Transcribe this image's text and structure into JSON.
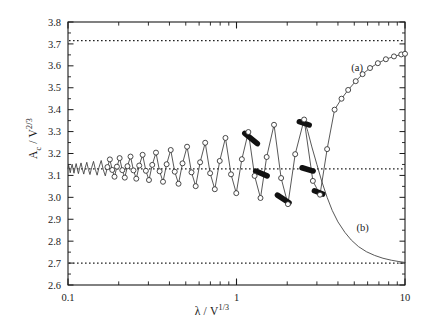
{
  "chart_data": {
    "type": "line",
    "title": "",
    "xlabel": "λ / V^(1/3)",
    "ylabel": "A_c / V^(2/3)",
    "xscale": "log",
    "yscale": "linear",
    "xlim": [
      0.1,
      10
    ],
    "ylim": [
      2.6,
      3.8
    ],
    "grid": false,
    "legend": "none",
    "x_ticks_major": [
      0.1,
      1,
      10
    ],
    "x_tick_labels": [
      "0.1",
      "1",
      "10"
    ],
    "x_ticks_minor": [
      0.2,
      0.3,
      0.4,
      0.5,
      0.6,
      0.7,
      0.8,
      0.9,
      2,
      3,
      4,
      5,
      6,
      7,
      8,
      9
    ],
    "y_ticks": [
      2.6,
      2.7,
      2.8,
      2.9,
      3.0,
      3.1,
      3.2,
      3.3,
      3.4,
      3.5,
      3.6,
      3.7,
      3.8
    ],
    "y_tick_labels": [
      "2.6",
      "2.7",
      "2.8",
      "2.9",
      "3.0",
      "3.1",
      "3.2",
      "3.3",
      "3.4",
      "3.5",
      "3.6",
      "3.7",
      "3.8"
    ],
    "asymptotes": [
      {
        "name": "upper-asymptote",
        "value": 3.715,
        "style": "dotted"
      },
      {
        "name": "middle-asymptote",
        "value": 3.13,
        "style": "dotted"
      },
      {
        "name": "lower-asymptote",
        "value": 2.7,
        "style": "dotted"
      }
    ],
    "annotations": [
      {
        "name": "branch-a-label",
        "text": "(a)",
        "x": 5.2,
        "y": 3.575
      },
      {
        "name": "branch-b-label",
        "text": "(b)",
        "x": 5.6,
        "y": 2.845
      }
    ],
    "series": [
      {
        "name": "spiral-branch",
        "description": "Oscillating spiral curve converging to the middle asymptote at small lambda and unwinding toward branch (a) at large lambda",
        "marker": "open-circle",
        "points": [
          [
            0.1,
            3.13
          ],
          [
            0.1008,
            3.147
          ],
          [
            0.1021,
            3.128
          ],
          [
            0.1031,
            3.112
          ],
          [
            0.1043,
            3.131
          ],
          [
            0.1058,
            3.151
          ],
          [
            0.1072,
            3.129
          ],
          [
            0.1085,
            3.11
          ],
          [
            0.11,
            3.132
          ],
          [
            0.1118,
            3.154
          ],
          [
            0.1136,
            3.128
          ],
          [
            0.1153,
            3.108
          ],
          [
            0.1172,
            3.133
          ],
          [
            0.1195,
            3.157
          ],
          [
            0.1218,
            3.128
          ],
          [
            0.124,
            3.106
          ],
          [
            0.1264,
            3.134
          ],
          [
            0.1293,
            3.16
          ],
          [
            0.1322,
            3.127
          ],
          [
            0.135,
            3.104
          ],
          [
            0.1381,
            3.135
          ],
          [
            0.1417,
            3.164
          ],
          [
            0.1454,
            3.127
          ],
          [
            0.1489,
            3.101
          ],
          [
            0.1528,
            3.137
          ],
          [
            0.1574,
            3.168
          ],
          [
            0.162,
            3.126
          ],
          [
            0.1665,
            3.098
          ],
          [
            0.1714,
            3.138
          ],
          [
            0.1772,
            3.173
          ],
          [
            0.1831,
            3.125
          ],
          [
            0.1888,
            3.094
          ],
          [
            0.1951,
            3.14
          ],
          [
            0.2025,
            3.179
          ],
          [
            0.21,
            3.124
          ],
          [
            0.2173,
            3.09
          ],
          [
            0.2254,
            3.142
          ],
          [
            0.235,
            3.186
          ],
          [
            0.2447,
            3.123
          ],
          [
            0.2542,
            3.085
          ],
          [
            0.2647,
            3.145
          ],
          [
            0.2772,
            3.194
          ],
          [
            0.2899,
            3.121
          ],
          [
            0.3024,
            3.079
          ],
          [
            0.3162,
            3.148
          ],
          [
            0.3327,
            3.204
          ],
          [
            0.3496,
            3.119
          ],
          [
            0.3663,
            3.071
          ],
          [
            0.3848,
            3.151
          ],
          [
            0.4071,
            3.216
          ],
          [
            0.43,
            3.117
          ],
          [
            0.4528,
            3.062
          ],
          [
            0.4781,
            3.155
          ],
          [
            0.5089,
            3.231
          ],
          [
            0.5407,
            3.114
          ],
          [
            0.5726,
            3.051
          ],
          [
            0.6082,
            3.16
          ],
          [
            0.652,
            3.249
          ],
          [
            0.6975,
            3.11
          ],
          [
            0.7435,
            3.037
          ],
          [
            0.7952,
            3.166
          ],
          [
            0.86,
            3.271
          ],
          [
            0.928,
            3.105
          ],
          [
            0.997,
            3.019
          ],
          [
            1.076,
            3.174
          ],
          [
            1.176,
            3.298
          ],
          [
            1.281,
            3.098
          ],
          [
            1.388,
            2.997
          ],
          [
            1.51,
            3.184
          ],
          [
            1.67,
            3.331
          ],
          [
            1.84,
            3.088
          ],
          [
            2.02,
            2.969
          ],
          [
            2.23,
            3.197
          ],
          [
            2.52,
            3.355
          ],
          [
            2.84,
            3.075
          ],
          [
            3.13,
            3.012
          ],
          [
            3.45,
            3.22
          ],
          [
            3.82,
            3.4
          ],
          [
            4.2,
            3.45
          ],
          [
            4.6,
            3.49
          ],
          [
            5.1,
            3.53
          ],
          [
            5.6,
            3.562
          ],
          [
            6.2,
            3.59
          ],
          [
            6.9,
            3.612
          ],
          [
            7.7,
            3.63
          ],
          [
            8.6,
            3.643
          ],
          [
            9.5,
            3.652
          ],
          [
            10.0,
            3.655
          ]
        ]
      },
      {
        "name": "branch-b-descent",
        "description": "Lower branch descending from the spiral toward the lower asymptote 2.70",
        "marker": "none",
        "points": [
          [
            2.52,
            3.355
          ],
          [
            2.65,
            3.3
          ],
          [
            2.8,
            3.23
          ],
          [
            3.0,
            3.15
          ],
          [
            3.2,
            3.075
          ],
          [
            3.45,
            3.0
          ],
          [
            3.7,
            2.94
          ],
          [
            4.0,
            2.888
          ],
          [
            4.4,
            2.84
          ],
          [
            4.8,
            2.805
          ],
          [
            5.3,
            2.775
          ],
          [
            5.9,
            2.752
          ],
          [
            6.6,
            2.735
          ],
          [
            7.4,
            2.722
          ],
          [
            8.3,
            2.713
          ],
          [
            9.2,
            2.707
          ],
          [
            10.0,
            2.703
          ]
        ]
      }
    ],
    "thick_segments": [
      {
        "name": "thick-segment-1",
        "x_start": 1.12,
        "x_end": 1.33,
        "y_start": 3.292,
        "y_end": 3.245
      },
      {
        "name": "thick-segment-2",
        "x_start": 1.3,
        "x_end": 1.52,
        "y_start": 3.12,
        "y_end": 3.098
      },
      {
        "name": "thick-segment-3",
        "x_start": 1.75,
        "x_end": 2.05,
        "y_start": 3.01,
        "y_end": 2.975
      },
      {
        "name": "thick-segment-4",
        "x_start": 2.36,
        "x_end": 2.7,
        "y_start": 3.345,
        "y_end": 3.33
      },
      {
        "name": "thick-segment-5",
        "x_start": 2.45,
        "x_end": 2.85,
        "y_start": 3.135,
        "y_end": 3.12
      },
      {
        "name": "thick-segment-6",
        "x_start": 2.9,
        "x_end": 3.25,
        "y_start": 3.03,
        "y_end": 3.015
      }
    ]
  },
  "axes": {
    "ylabel_prefix": "A",
    "ylabel_sub": "c",
    "ylabel_mid": " / V",
    "ylabel_sup": "2/3",
    "xlabel_prefix": "λ / V",
    "xlabel_sup": "1/3"
  },
  "colors": {
    "axis": "#1a1a1a",
    "curve": "#3a3a3a",
    "marker_stroke": "#2a2a2a",
    "marker_fill": "#ffffff",
    "thick": "#111111",
    "dotted": "#222222",
    "background": "#ffffff"
  }
}
